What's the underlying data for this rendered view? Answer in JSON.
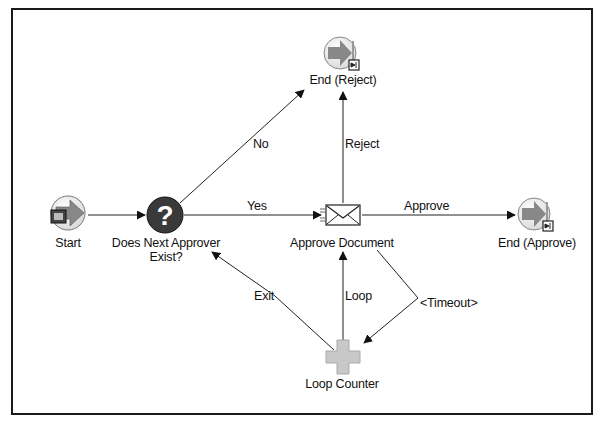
{
  "diagram": {
    "type": "workflow-process",
    "nodes": [
      {
        "id": "start",
        "label": "Start",
        "icon": "start-arrow-icon"
      },
      {
        "id": "decision",
        "label_line1": "Does Next Approver",
        "label_line2": "Exist?",
        "icon": "question-icon"
      },
      {
        "id": "approve_doc",
        "label": "Approve Document",
        "icon": "envelope-notification-icon"
      },
      {
        "id": "end_reject",
        "label": "End (Reject)",
        "icon": "end-arrow-icon"
      },
      {
        "id": "end_approve",
        "label": "End (Approve)",
        "icon": "end-arrow-icon"
      },
      {
        "id": "loop_counter",
        "label": "Loop Counter",
        "icon": "plus-icon"
      }
    ],
    "edges": [
      {
        "from": "start",
        "to": "decision",
        "label": ""
      },
      {
        "from": "decision",
        "to": "end_reject",
        "label": "No"
      },
      {
        "from": "decision",
        "to": "approve_doc",
        "label": "Yes"
      },
      {
        "from": "approve_doc",
        "to": "end_reject",
        "label": "Reject"
      },
      {
        "from": "approve_doc",
        "to": "end_approve",
        "label": "Approve"
      },
      {
        "from": "approve_doc",
        "to": "loop_counter",
        "label": "<Timeout>"
      },
      {
        "from": "loop_counter",
        "to": "approve_doc",
        "label": "Loop"
      },
      {
        "from": "loop_counter",
        "to": "decision",
        "label": "Exit"
      }
    ]
  },
  "colors": {
    "border": "#1a1a1a",
    "line": "#222222",
    "question_fill": "#3a3a3a",
    "arrow_fill": "#8a8a8a",
    "plus_fill": "#c8c8c8"
  }
}
